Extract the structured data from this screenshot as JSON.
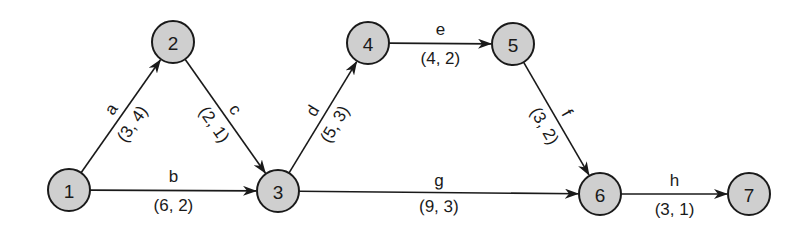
{
  "diagram": {
    "type": "activity-on-arrow network",
    "node_style": {
      "fill": "#cfcfcf",
      "stroke": "#1a1a1a",
      "radius": 21
    },
    "nodes": [
      {
        "id": "1",
        "label": "1",
        "x": 69,
        "y": 190
      },
      {
        "id": "2",
        "label": "2",
        "x": 173,
        "y": 42
      },
      {
        "id": "3",
        "label": "3",
        "x": 278,
        "y": 191
      },
      {
        "id": "4",
        "label": "4",
        "x": 368,
        "y": 43
      },
      {
        "id": "5",
        "label": "5",
        "x": 513,
        "y": 44
      },
      {
        "id": "6",
        "label": "6",
        "x": 600,
        "y": 194
      },
      {
        "id": "7",
        "label": "7",
        "x": 749,
        "y": 194
      }
    ],
    "edges": [
      {
        "id": "a",
        "name": "a",
        "weight": "(3, 4)",
        "from": "1",
        "to": "2"
      },
      {
        "id": "b",
        "name": "b",
        "weight": "(6, 2)",
        "from": "1",
        "to": "3"
      },
      {
        "id": "c",
        "name": "c",
        "weight": "(2, 1)",
        "from": "2",
        "to": "3"
      },
      {
        "id": "d",
        "name": "d",
        "weight": "(5, 3)",
        "from": "3",
        "to": "4"
      },
      {
        "id": "e",
        "name": "e",
        "weight": "(4, 2)",
        "from": "4",
        "to": "5"
      },
      {
        "id": "f",
        "name": "f",
        "weight": "(3, 2)",
        "from": "5",
        "to": "6"
      },
      {
        "id": "g",
        "name": "g",
        "weight": "(9, 3)",
        "from": "3",
        "to": "6"
      },
      {
        "id": "h",
        "name": "h",
        "weight": "(3, 1)",
        "from": "6",
        "to": "7"
      }
    ]
  }
}
